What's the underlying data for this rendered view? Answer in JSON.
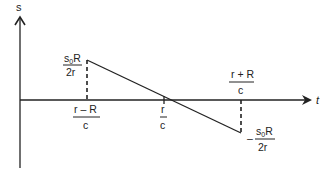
{
  "diagram": {
    "type": "piecewise-linear signal plot",
    "y_axis_label": "s",
    "x_axis_label": "t",
    "peak_label": {
      "num_base": "s",
      "num_sub": "0",
      "num_tail": "R",
      "den": "2r"
    },
    "trough_label": {
      "sign": "–",
      "num_base": "s",
      "num_sub": "0",
      "num_tail": "R",
      "den": "2r"
    },
    "tick_1": {
      "num": "r – R",
      "den": "c"
    },
    "tick_2": {
      "num": "r",
      "den": "c"
    },
    "tick_3": {
      "num": "r + R",
      "den": "c"
    }
  },
  "colors": {
    "ink": "#222222",
    "background": "#ffffff"
  }
}
